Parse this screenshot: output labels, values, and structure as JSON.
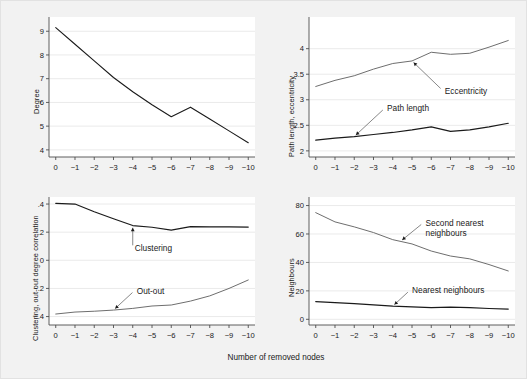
{
  "figure": {
    "background_color": "#f2f2f2",
    "plot_background_color": "#ffffff",
    "grid_color": "#e8e8e8",
    "axis_color": "#4d4d4d",
    "line_color_dark": "#1a1a1a",
    "line_color_light": "#7a7a7a",
    "xlabel": "Number of removed nodes"
  },
  "chart_data": [
    {
      "type": "line",
      "panel": "top-left",
      "title": "",
      "xlabel": "",
      "ylabel": "Degree",
      "x": [
        0,
        -1,
        -2,
        -3,
        -4,
        -5,
        -6,
        -7,
        -8,
        -9,
        -10
      ],
      "xticklabels": [
        "0",
        "−1",
        "−2",
        "−3",
        "−4",
        "−5",
        "−6",
        "−7",
        "−8",
        "−9",
        "−10"
      ],
      "yticks": [
        4,
        5,
        6,
        7,
        8,
        9
      ],
      "yticklabels": [
        "4",
        "5",
        "6",
        "7",
        "8",
        "9"
      ],
      "ylim": [
        3.7,
        9.6
      ],
      "xlim": [
        0.35,
        -10.35
      ],
      "grid": true,
      "legend": "none",
      "series": [
        {
          "name": "Degree",
          "color": "#1a1a1a",
          "width": 1.1,
          "values": [
            9.15,
            8.45,
            7.75,
            7.05,
            6.45,
            5.9,
            5.4,
            5.8,
            5.3,
            4.8,
            4.3
          ]
        }
      ]
    },
    {
      "type": "line",
      "panel": "top-right",
      "title": "",
      "xlabel": "",
      "ylabel": "Path length, eccentricity",
      "x": [
        0,
        -1,
        -2,
        -3,
        -4,
        -5,
        -6,
        -7,
        -8,
        -9,
        -10
      ],
      "xticklabels": [
        "0",
        "−1",
        "−2",
        "−3",
        "−4",
        "−5",
        "−6",
        "−7",
        "−8",
        "−9",
        "−10"
      ],
      "yticks": [
        2,
        2.5,
        3,
        3.5,
        4
      ],
      "yticklabels": [
        "2",
        "2.5",
        "3",
        "3.5",
        "4"
      ],
      "ylim": [
        1.88,
        4.62
      ],
      "xlim": [
        0.35,
        -10.35
      ],
      "grid": true,
      "legend": "annotations",
      "series": [
        {
          "name": "Eccentricity",
          "color": "#6e6e6e",
          "width": 1.0,
          "values": [
            3.26,
            3.38,
            3.47,
            3.6,
            3.71,
            3.76,
            3.93,
            3.89,
            3.91,
            4.03,
            4.16
          ]
        },
        {
          "name": "Path length",
          "color": "#1a1a1a",
          "width": 1.2,
          "values": [
            2.21,
            2.25,
            2.28,
            2.32,
            2.36,
            2.41,
            2.47,
            2.38,
            2.41,
            2.47,
            2.54
          ]
        }
      ],
      "annotations": [
        {
          "text": "Eccentricity",
          "target_x": -5.0,
          "target_y": 3.76,
          "label_x": -6.6,
          "label_y": 3.18
        },
        {
          "text": "Path length",
          "target_x": -2.0,
          "target_y": 2.28,
          "label_x": -3.6,
          "label_y": 2.84
        }
      ]
    },
    {
      "type": "line",
      "panel": "bottom-left",
      "title": "",
      "xlabel": "Number of removed nodes",
      "ylabel": "Clustering, out-out degree correlation",
      "x": [
        0,
        -1,
        -2,
        -3,
        -4,
        -5,
        -6,
        -7,
        -8,
        -9,
        -10
      ],
      "xticklabels": [
        "0",
        "−1",
        "−2",
        "−3",
        "−4",
        "−5",
        "−6",
        "−7",
        "−8",
        "−9",
        "−10"
      ],
      "yticks": [
        0.4,
        0.2,
        0,
        -0.2,
        -0.4
      ],
      "yticklabels": [
        ".4",
        ".2",
        "0",
        "−.2",
        "−.4"
      ],
      "ylim": [
        -0.46,
        0.45
      ],
      "xlim": [
        0.35,
        -10.35
      ],
      "grid": true,
      "legend": "annotations",
      "series": [
        {
          "name": "Clustering",
          "color": "#1a1a1a",
          "width": 1.2,
          "values": [
            0.405,
            0.4,
            0.345,
            0.295,
            0.247,
            0.235,
            0.215,
            0.24,
            0.238,
            0.237,
            0.236
          ]
        },
        {
          "name": "Out-out",
          "color": "#6e6e6e",
          "width": 1.0,
          "values": [
            -0.382,
            -0.368,
            -0.362,
            -0.354,
            -0.342,
            -0.325,
            -0.318,
            -0.29,
            -0.253,
            -0.2,
            -0.14
          ]
        }
      ],
      "annotations": [
        {
          "text": "Clustering",
          "target_x": -4.0,
          "target_y": 0.247,
          "label_x": -4.0,
          "label_y": 0.085
        },
        {
          "text": "Out-out",
          "target_x": -3.0,
          "target_y": -0.354,
          "label_x": -4.1,
          "label_y": -0.215
        }
      ]
    },
    {
      "type": "line",
      "panel": "bottom-right",
      "title": "",
      "xlabel": "Number of removed nodes",
      "ylabel": "Neighbours",
      "x": [
        0,
        -1,
        -2,
        -3,
        -4,
        -5,
        -6,
        -7,
        -8,
        -9,
        -10
      ],
      "xticklabels": [
        "0",
        "−1",
        "−2",
        "−3",
        "−4",
        "−5",
        "−6",
        "−7",
        "−8",
        "−9",
        "−10"
      ],
      "yticks": [
        0,
        20,
        40,
        60,
        80
      ],
      "yticklabels": [
        "0",
        "20",
        "40",
        "60",
        "80"
      ],
      "ylim": [
        -4,
        86
      ],
      "xlim": [
        0.35,
        -10.35
      ],
      "grid": true,
      "legend": "annotations",
      "series": [
        {
          "name": "Second nearest neighbours",
          "color": "#6e6e6e",
          "width": 1.0,
          "values": [
            75,
            68.5,
            65,
            61,
            56,
            53,
            48,
            44.5,
            42.5,
            38.5,
            34
          ]
        },
        {
          "name": "Nearest neighbours",
          "color": "#1a1a1a",
          "width": 1.2,
          "values": [
            12.5,
            11.8,
            11.0,
            10.2,
            9.3,
            8.8,
            8.2,
            8.6,
            8.2,
            7.6,
            7.2
          ]
        }
      ],
      "annotations": [
        {
          "text": "Second nearest",
          "text2": "neighbours",
          "target_x": -4.4,
          "target_y": 54.8,
          "label_x": -5.6,
          "label_y": 68.0
        },
        {
          "text": "Nearest neighbours",
          "target_x": -4.0,
          "target_y": 9.3,
          "label_x": -4.9,
          "label_y": 20.5
        }
      ]
    }
  ]
}
